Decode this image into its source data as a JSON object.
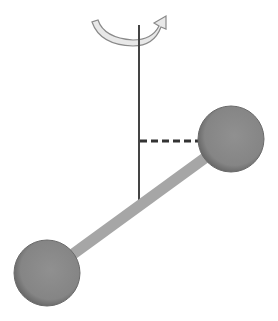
{
  "diagram": {
    "colors": {
      "background": "#ffffff",
      "axis": "#444444",
      "rod": "#a6a6a6",
      "ball": "#8a8a8a",
      "ball_edge": "#5e5e5e",
      "arrow_fill": "#e8e8e8",
      "arrow_stroke": "#888888",
      "dash": "#333333"
    },
    "elements": {
      "rotation_arrow": "rotation-arrow",
      "axis": "vertical-axis",
      "perpendicular_distance": "dashed-line",
      "rod": "connecting-rod",
      "mass_upper": "upper-mass",
      "mass_lower": "lower-mass"
    }
  }
}
